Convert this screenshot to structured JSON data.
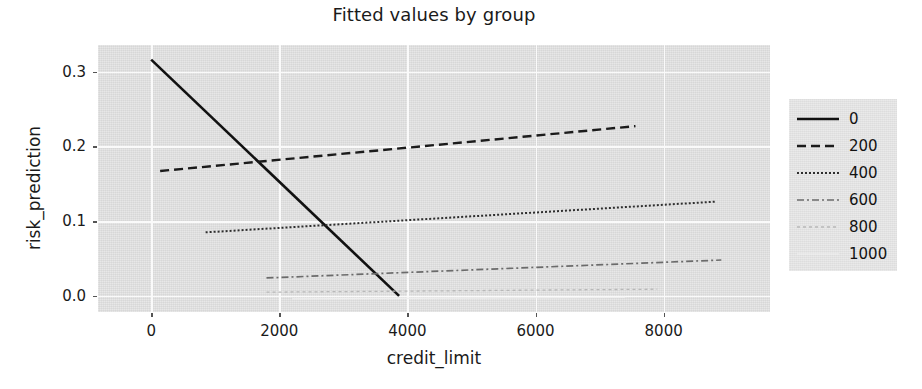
{
  "chart_data": {
    "type": "line",
    "title": "Fitted values by group",
    "xlabel": "credit_limit",
    "ylabel": "risk_prediction",
    "xlim": [
      -830,
      9660
    ],
    "ylim": [
      -0.0215,
      0.3355
    ],
    "xticks": [
      0,
      2000,
      4000,
      6000,
      8000
    ],
    "xticklabels": [
      "0",
      "2000",
      "4000",
      "6000",
      "8000"
    ],
    "yticks": [
      0.0,
      0.1,
      0.2,
      0.3
    ],
    "yticklabels": [
      "0.0",
      "0.1",
      "0.2",
      "0.3"
    ],
    "grid": true,
    "grid_color": "#fafafa",
    "panel_color": "#e4e4e4",
    "legend_position": "right outside",
    "legend_title": "",
    "series": [
      {
        "name": "0",
        "label": "0",
        "linestyle": "solid",
        "color": "#111111",
        "linewidth": 2.6,
        "dasharray": "",
        "x": [
          0,
          3870
        ],
        "y": [
          0.316,
          0.0
        ]
      },
      {
        "name": "200",
        "label": "200",
        "linestyle": "dashed",
        "color": "#1b1b1b",
        "linewidth": 2.4,
        "dasharray": "9,5",
        "x": [
          140,
          7560
        ],
        "y": [
          0.167,
          0.227
        ]
      },
      {
        "name": "400",
        "label": "400",
        "linestyle": "dotted",
        "color": "#2e2e2e",
        "linewidth": 2.0,
        "dasharray": "2,2",
        "x": [
          850,
          8800
        ],
        "y": [
          0.085,
          0.126
        ]
      },
      {
        "name": "600",
        "label": "600",
        "linestyle": "dashdot",
        "color": "#6b6b6b",
        "linewidth": 1.7,
        "dasharray": "7,3,2,3",
        "x": [
          1800,
          8900
        ],
        "y": [
          0.024,
          0.048
        ]
      },
      {
        "name": "800",
        "label": "800",
        "linestyle": "dotted-faint",
        "color": "#b8b8b8",
        "linewidth": 1.3,
        "dasharray": "3,3",
        "x": [
          1800,
          7900
        ],
        "y": [
          0.005,
          0.009
        ]
      },
      {
        "name": "1000",
        "label": "1000",
        "linestyle": "solid-faint",
        "color": "#efefef",
        "linewidth": 1.2,
        "dasharray": "",
        "x": [
          2200,
          7400
        ],
        "y": [
          -0.004,
          -0.002
        ]
      }
    ]
  }
}
